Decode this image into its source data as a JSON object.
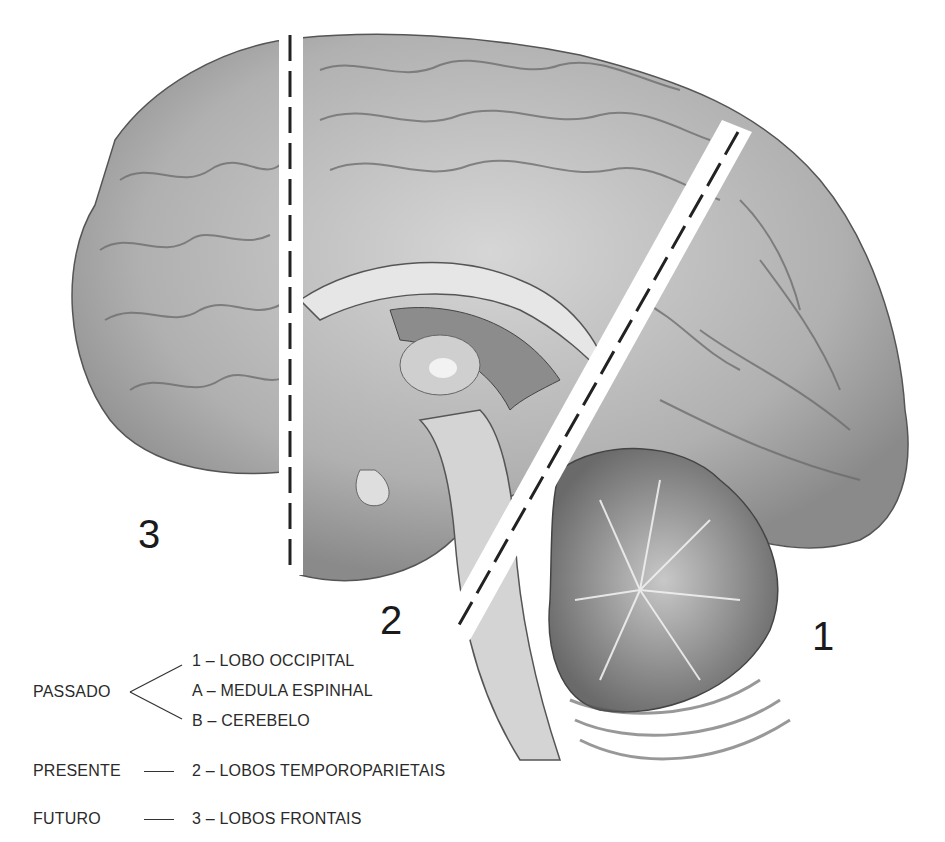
{
  "diagram": {
    "title": "",
    "regions": [
      {
        "id": "3",
        "label": "3"
      },
      {
        "id": "2",
        "label": "2"
      },
      {
        "id": "1",
        "label": "1"
      }
    ],
    "divider_style": "dashed",
    "colors": {
      "background": "#ffffff",
      "cortex": "#b8b8b8",
      "cortex_dark": "#6e6e6e",
      "white_matter": "#dcdcdc",
      "cerebellum": "#9a9a9a",
      "text": "#222222"
    }
  },
  "legend": {
    "past": {
      "label": "PASSADO",
      "items": [
        {
          "key": "1",
          "text": "1 – LOBO OCCIPITAL"
        },
        {
          "key": "A",
          "text": "A – MEDULA ESPINHAL"
        },
        {
          "key": "B",
          "text": "B – CEREBELO"
        }
      ]
    },
    "present": {
      "label": "PRESENTE",
      "item": "2 – LOBOS TEMPOROPARIETAIS"
    },
    "future": {
      "label": "FUTURO",
      "item": "3 –  LOBOS FRONTAIS"
    }
  }
}
